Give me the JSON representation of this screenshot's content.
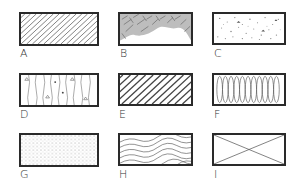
{
  "figure": {
    "swatches": [
      {
        "label": "A",
        "pattern": "diagonal-hatch-fine"
      },
      {
        "label": "B",
        "pattern": "scribbled-crosshatch-partial"
      },
      {
        "label": "C",
        "pattern": "stipple-with-specks"
      },
      {
        "label": "D",
        "pattern": "vertical-wavy-with-marks"
      },
      {
        "label": "E",
        "pattern": "diagonal-hatch-double"
      },
      {
        "label": "F",
        "pattern": "vertical-loops"
      },
      {
        "label": "G",
        "pattern": "fine-stipple"
      },
      {
        "label": "H",
        "pattern": "wavy-wood-grain"
      },
      {
        "label": "I",
        "pattern": "cross-diagonal-x"
      }
    ]
  }
}
